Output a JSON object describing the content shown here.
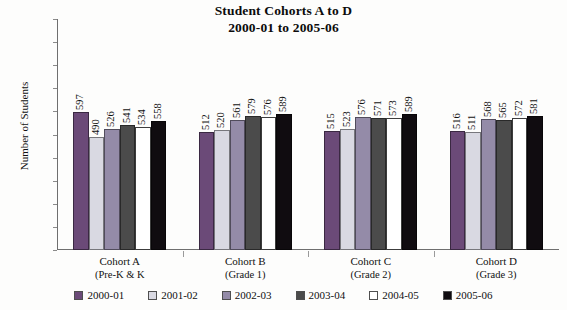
{
  "chart_data": {
    "type": "bar",
    "title": "Student Cohorts A to D",
    "subtitle": "2000-01 to 2005-06",
    "xlabel": "",
    "ylabel": "Number of Students",
    "ylim": [
      0,
      1000
    ],
    "ytick_step": 100,
    "yticks": [
      "1000",
      "900",
      "800",
      "700",
      "600",
      "500",
      "400",
      "300",
      "200",
      "100",
      "0"
    ],
    "grid": false,
    "legend_position": "bottom",
    "categories": [
      "Cohort A",
      "Cohort B",
      "Cohort C",
      "Cohort D"
    ],
    "category_sublabels": [
      "(Pre-K & K",
      "(Grade 1)",
      "(Grade 2)",
      "(Grade 3)"
    ],
    "series": [
      {
        "name": "2000-01",
        "color": "#6b4a78",
        "values": [
          597,
          512,
          515,
          516
        ]
      },
      {
        "name": "2001-02",
        "color": "#d9d9e2",
        "values": [
          490,
          520,
          523,
          511
        ]
      },
      {
        "name": "2002-03",
        "color": "#948ba8",
        "values": [
          526,
          561,
          576,
          568
        ]
      },
      {
        "name": "2003-04",
        "color": "#4b4b4b",
        "values": [
          541,
          579,
          571,
          565
        ]
      },
      {
        "name": "2004-05",
        "color": "#ffffff",
        "values": [
          534,
          576,
          573,
          572
        ]
      },
      {
        "name": "2005-06",
        "color": "#100c10",
        "values": [
          558,
          589,
          589,
          581
        ]
      }
    ]
  }
}
